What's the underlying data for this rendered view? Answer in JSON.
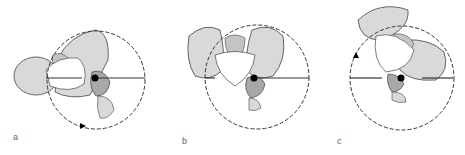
{
  "figure": {
    "panels": [
      {
        "id": "a",
        "label": "a",
        "subject": "pelvis rotated view",
        "rotation_arrow": "clockwise-bottom"
      },
      {
        "id": "b",
        "label": "b",
        "subject": "pelvis frontal view",
        "rotation_arrow": "none"
      },
      {
        "id": "c",
        "label": "c",
        "subject": "pelvis rotated view",
        "rotation_arrow": "counterclockwise-left"
      }
    ],
    "colors": {
      "bone_light": "#d9d9d9",
      "bone_dark": "#a8a8a8",
      "outline": "#444444",
      "circle": "#333333",
      "pivot": "#000000"
    }
  }
}
